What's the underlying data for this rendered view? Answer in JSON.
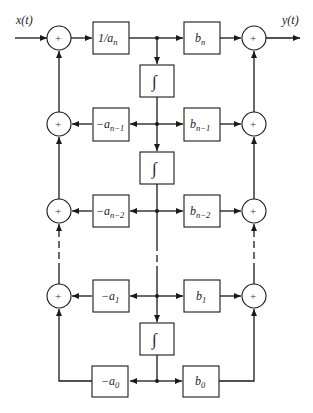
{
  "diagram": {
    "title": "",
    "input_label": "x(t)",
    "output_label": "y(t)",
    "summer_symbol": "+",
    "integrator_symbol": "∫",
    "feedback_gains": [
      {
        "base": "1/a",
        "sub": "n"
      },
      {
        "base": "−a",
        "sub": "n−1"
      },
      {
        "base": "−a",
        "sub": "n−2"
      },
      {
        "base": "−a",
        "sub": "1"
      },
      {
        "base": "−a",
        "sub": "0"
      }
    ],
    "feedforward_gains": [
      {
        "base": "b",
        "sub": "n"
      },
      {
        "base": "b",
        "sub": "n−1"
      },
      {
        "base": "b",
        "sub": "n−2"
      },
      {
        "base": "b",
        "sub": "1"
      },
      {
        "base": "b",
        "sub": "0"
      }
    ],
    "integrators": 3,
    "colors": {
      "line": "#1a1a1a",
      "background": "#ffffff"
    }
  }
}
